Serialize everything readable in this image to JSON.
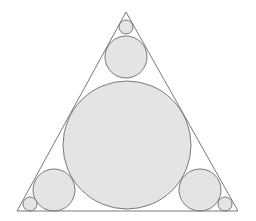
{
  "diagram": {
    "type": "inscribed-circles-in-equilateral-triangle",
    "colors": {
      "background": "#ffffff",
      "stroke": "#7a7a7a",
      "circle_fill": "#e4e4e4"
    },
    "triangle": {
      "points": "126,12 238,211 17,211"
    },
    "circles": [
      {
        "name": "incircle-large",
        "cx": 127,
        "cy": 145,
        "r": 64
      },
      {
        "name": "top-medium",
        "cx": 126,
        "cy": 57,
        "r": 21
      },
      {
        "name": "top-small",
        "cx": 126,
        "cy": 27,
        "r": 7
      },
      {
        "name": "left-medium",
        "cx": 54,
        "cy": 190,
        "r": 21
      },
      {
        "name": "left-small",
        "cx": 30,
        "cy": 204,
        "r": 7
      },
      {
        "name": "right-medium",
        "cx": 200,
        "cy": 190,
        "r": 21
      },
      {
        "name": "right-small",
        "cx": 225,
        "cy": 204,
        "r": 7
      }
    ]
  }
}
